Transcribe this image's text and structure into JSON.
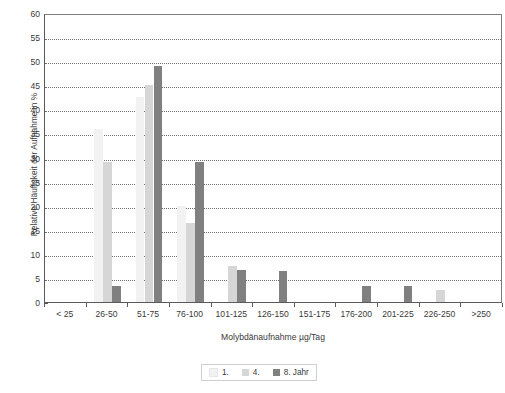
{
  "chart_data": {
    "type": "bar",
    "title": "",
    "subtitle": "",
    "xlabel": "Molybdänaufnahme µg/Tag",
    "ylabel": "Relative Häufigkeit der Aufnahme in %",
    "categories": [
      "< 25",
      "26-50",
      "51-75",
      "76-100",
      "101-125",
      "126-150",
      "151-175",
      "176-200",
      "201-225",
      "226-250",
      ">250"
    ],
    "series": [
      {
        "name": "1.",
        "color": "#f2f2f2",
        "values": [
          0,
          36,
          42.5,
          20,
          0,
          0,
          0,
          0,
          0,
          0,
          0
        ]
      },
      {
        "name": "4.",
        "color": "#d6d6d6",
        "values": [
          0,
          29,
          45,
          16.5,
          7.5,
          0,
          0,
          0,
          0,
          2.5,
          0
        ]
      },
      {
        "name": "8. Jahr",
        "color": "#808080",
        "values": [
          0,
          3.3,
          49,
          29,
          6.7,
          6.5,
          0,
          3.3,
          3.3,
          0,
          0
        ]
      }
    ],
    "ylim": [
      0,
      60
    ],
    "ytick_step": 5,
    "yticks": [
      0,
      5,
      10,
      15,
      20,
      25,
      30,
      35,
      40,
      45,
      50,
      55,
      60
    ],
    "grid": true,
    "grid_style": "dotted-horizontal",
    "legend_position": "bottom-center",
    "legend_entries": [
      "1.",
      "4.",
      "8. Jahr"
    ],
    "axis_color": "#5a5a5a",
    "frame_color": "#7d7d7d",
    "background": "#ffffff"
  }
}
